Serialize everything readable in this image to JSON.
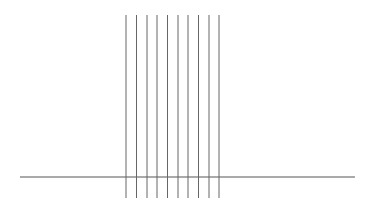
{
  "diagram": {
    "canvas": {
      "width": 371,
      "height": 201,
      "background": "#ffffff"
    },
    "baseline": {
      "x1": 20,
      "x2": 355,
      "y": 177,
      "color": "#555555",
      "width": 1
    },
    "vertical_lines": {
      "count": 10,
      "y_top": 15,
      "y_bottom": 198,
      "color": "#666666",
      "width": 1,
      "x_positions": [
        126,
        136.5,
        147,
        157,
        167.5,
        178,
        188,
        198.5,
        209,
        219
      ]
    }
  }
}
